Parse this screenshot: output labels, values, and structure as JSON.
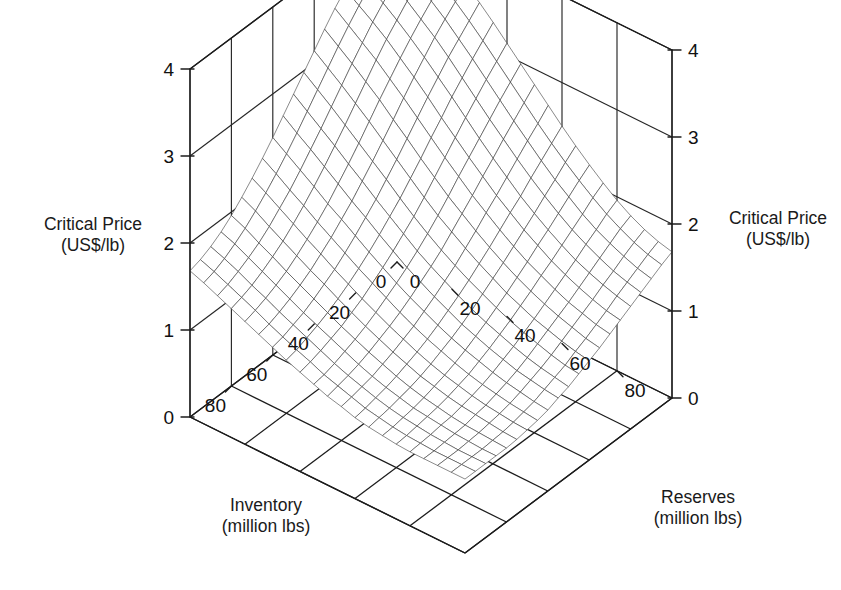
{
  "figure": {
    "type": "3d-surface-wireframe",
    "background": "#ffffff",
    "ink_color": "#1c1c1c"
  },
  "axes": {
    "z_left": {
      "title_line1": "Critical Price",
      "title_line2": "(US$/lb)",
      "ticks": [
        "0",
        "1",
        "2",
        "3",
        "4"
      ],
      "min": 0,
      "max": 4
    },
    "z_right": {
      "title_line1": "Critical Price",
      "title_line2": "(US$/lb)",
      "ticks": [
        "0",
        "1",
        "2",
        "3",
        "4"
      ],
      "min": 0,
      "max": 4
    },
    "x_inventory": {
      "title_line1": "Inventory",
      "title_line2": "(million lbs)",
      "ticks": [
        "0",
        "20",
        "40",
        "60",
        "80"
      ],
      "min": 0,
      "max": 100
    },
    "y_reserves": {
      "title_line1": "Reserves",
      "title_line2": "(million lbs)",
      "ticks": [
        "0",
        "20",
        "40",
        "60",
        "80"
      ],
      "min": 0,
      "max": 100
    }
  },
  "chart_data": {
    "type": "surface",
    "title": "",
    "xlabel": "Inventory (million lbs)",
    "ylabel": "Reserves (million lbs)",
    "zlabel": "Critical Price (US$/lb)",
    "xlim": [
      0,
      100
    ],
    "ylim": [
      0,
      100
    ],
    "zlim": [
      0,
      4
    ],
    "xticks": [
      0,
      20,
      40,
      60,
      80
    ],
    "yticks": [
      0,
      20,
      40,
      60,
      80
    ],
    "zticks": [
      0,
      1,
      2,
      3,
      4
    ],
    "grid": true,
    "legend": "none",
    "x": [
      0,
      5,
      10,
      15,
      20,
      25,
      30,
      35,
      40,
      45,
      50,
      55,
      60,
      65,
      70,
      75,
      80,
      85,
      90,
      95,
      100
    ],
    "y": [
      0,
      5,
      10,
      15,
      20,
      25,
      30,
      35,
      40,
      45,
      50,
      55,
      60,
      65,
      70,
      75,
      80,
      85,
      90,
      95,
      100
    ],
    "z_description": "Critical price surface: highest (~4.0 US$/lb) at low inventory and low reserves; declines monotonically, flattening to ~0.85 US$/lb at high inventory and high reserves. Terraced/stepped contour structure visible across the mid-range.",
    "z": [
      [
        4.0,
        3.95,
        3.88,
        3.8,
        3.7,
        3.58,
        3.45,
        3.3,
        3.14,
        2.98,
        2.82,
        2.66,
        2.5,
        2.35,
        2.21,
        2.08,
        1.96,
        1.86,
        1.78,
        1.72,
        1.68
      ],
      [
        3.95,
        3.88,
        3.8,
        3.71,
        3.6,
        3.47,
        3.33,
        3.18,
        3.02,
        2.86,
        2.7,
        2.54,
        2.39,
        2.25,
        2.12,
        2.0,
        1.89,
        1.8,
        1.72,
        1.66,
        1.62
      ],
      [
        3.88,
        3.8,
        3.71,
        3.61,
        3.49,
        3.36,
        3.21,
        3.06,
        2.9,
        2.74,
        2.58,
        2.43,
        2.28,
        2.14,
        2.02,
        1.9,
        1.8,
        1.72,
        1.65,
        1.59,
        1.55
      ],
      [
        3.8,
        3.71,
        3.61,
        3.5,
        3.37,
        3.24,
        3.09,
        2.93,
        2.77,
        2.61,
        2.46,
        2.31,
        2.17,
        2.04,
        1.92,
        1.81,
        1.72,
        1.64,
        1.57,
        1.52,
        1.48
      ],
      [
        3.7,
        3.6,
        3.49,
        3.37,
        3.24,
        3.1,
        2.95,
        2.8,
        2.64,
        2.48,
        2.33,
        2.19,
        2.05,
        1.93,
        1.82,
        1.72,
        1.63,
        1.56,
        1.5,
        1.45,
        1.41
      ],
      [
        3.58,
        3.47,
        3.36,
        3.24,
        3.1,
        2.96,
        2.81,
        2.65,
        2.5,
        2.35,
        2.21,
        2.07,
        1.95,
        1.83,
        1.73,
        1.63,
        1.55,
        1.48,
        1.42,
        1.37,
        1.34
      ],
      [
        3.45,
        3.33,
        3.21,
        3.09,
        2.95,
        2.81,
        2.66,
        2.51,
        2.36,
        2.22,
        2.08,
        1.96,
        1.84,
        1.73,
        1.63,
        1.55,
        1.47,
        1.4,
        1.35,
        1.3,
        1.27
      ],
      [
        3.3,
        3.18,
        3.06,
        2.93,
        2.8,
        2.65,
        2.51,
        2.36,
        2.22,
        2.08,
        1.96,
        1.84,
        1.73,
        1.63,
        1.54,
        1.46,
        1.39,
        1.33,
        1.28,
        1.23,
        1.2
      ],
      [
        3.14,
        3.02,
        2.9,
        2.77,
        2.64,
        2.5,
        2.36,
        2.22,
        2.08,
        1.95,
        1.84,
        1.73,
        1.63,
        1.54,
        1.45,
        1.38,
        1.31,
        1.26,
        1.21,
        1.17,
        1.14
      ],
      [
        2.98,
        2.86,
        2.74,
        2.61,
        2.48,
        2.35,
        2.22,
        2.08,
        1.95,
        1.83,
        1.72,
        1.62,
        1.53,
        1.45,
        1.37,
        1.3,
        1.24,
        1.19,
        1.14,
        1.1,
        1.08
      ],
      [
        2.82,
        2.7,
        2.58,
        2.46,
        2.33,
        2.21,
        2.08,
        1.96,
        1.84,
        1.72,
        1.62,
        1.53,
        1.44,
        1.36,
        1.29,
        1.23,
        1.17,
        1.12,
        1.08,
        1.05,
        1.02
      ],
      [
        2.66,
        2.54,
        2.43,
        2.31,
        2.19,
        2.07,
        1.96,
        1.84,
        1.73,
        1.62,
        1.53,
        1.44,
        1.36,
        1.28,
        1.22,
        1.16,
        1.11,
        1.06,
        1.03,
        1.0,
        0.98
      ],
      [
        2.5,
        2.39,
        2.28,
        2.17,
        2.05,
        1.95,
        1.84,
        1.73,
        1.63,
        1.53,
        1.44,
        1.36,
        1.28,
        1.21,
        1.15,
        1.1,
        1.05,
        1.01,
        0.98,
        0.95,
        0.93
      ],
      [
        2.35,
        2.25,
        2.14,
        2.04,
        1.93,
        1.83,
        1.73,
        1.63,
        1.54,
        1.45,
        1.36,
        1.28,
        1.21,
        1.15,
        1.09,
        1.04,
        1.0,
        0.97,
        0.94,
        0.92,
        0.9
      ],
      [
        2.21,
        2.12,
        2.02,
        1.92,
        1.82,
        1.73,
        1.63,
        1.54,
        1.45,
        1.37,
        1.29,
        1.22,
        1.15,
        1.09,
        1.04,
        1.0,
        0.96,
        0.93,
        0.91,
        0.89,
        0.88
      ],
      [
        2.08,
        2.0,
        1.9,
        1.81,
        1.72,
        1.63,
        1.55,
        1.46,
        1.38,
        1.3,
        1.23,
        1.16,
        1.1,
        1.04,
        1.0,
        0.96,
        0.93,
        0.91,
        0.89,
        0.87,
        0.86
      ],
      [
        1.96,
        1.89,
        1.8,
        1.72,
        1.63,
        1.55,
        1.47,
        1.39,
        1.31,
        1.24,
        1.17,
        1.11,
        1.05,
        1.0,
        0.96,
        0.93,
        0.9,
        0.88,
        0.87,
        0.86,
        0.85
      ],
      [
        1.86,
        1.8,
        1.72,
        1.64,
        1.56,
        1.48,
        1.4,
        1.33,
        1.26,
        1.19,
        1.12,
        1.06,
        1.01,
        0.97,
        0.93,
        0.91,
        0.89,
        0.87,
        0.86,
        0.85,
        0.85
      ],
      [
        1.78,
        1.72,
        1.65,
        1.57,
        1.5,
        1.42,
        1.35,
        1.28,
        1.21,
        1.14,
        1.08,
        1.03,
        0.98,
        0.94,
        0.91,
        0.89,
        0.87,
        0.86,
        0.85,
        0.85,
        0.85
      ],
      [
        1.72,
        1.66,
        1.59,
        1.52,
        1.45,
        1.37,
        1.3,
        1.23,
        1.17,
        1.1,
        1.05,
        1.0,
        0.95,
        0.92,
        0.89,
        0.87,
        0.86,
        0.85,
        0.85,
        0.85,
        0.85
      ],
      [
        1.68,
        1.62,
        1.55,
        1.48,
        1.41,
        1.34,
        1.27,
        1.2,
        1.14,
        1.08,
        1.02,
        0.98,
        0.93,
        0.9,
        0.88,
        0.86,
        0.85,
        0.85,
        0.85,
        0.85,
        0.85
      ]
    ]
  },
  "geometry": {
    "origin_left": [
      190,
      417
    ],
    "origin_right": [
      672,
      398
    ],
    "back_corner": [
      468,
      25
    ],
    "front_corner": [
      465,
      553
    ],
    "z_unit_px": 87
  }
}
